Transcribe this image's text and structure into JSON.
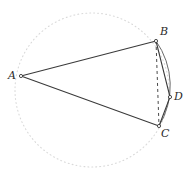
{
  "figure": {
    "type": "geometry-diagram",
    "width": 191,
    "height": 175,
    "background_color": "#ffffff"
  },
  "colors": {
    "circle_dotted": "#d9d9d9",
    "solid_line": "#3a3a3a",
    "arc_line": "#6b6b6b",
    "dashed_line": "#4a4a4a",
    "label_text": "#2b2b2b",
    "vertex_marker": "#ffffff"
  },
  "circle": {
    "name": "dotted-circle",
    "center_x": 92,
    "center_y": 90,
    "radius": 77,
    "style": "dotted",
    "stroke_width": 1.1,
    "dash_pattern": "0.9 3.1"
  },
  "points": [
    {
      "id": "A",
      "label": "A",
      "x": 21,
      "y": 76,
      "label_x": 8,
      "label_y": 70,
      "marker": "open-circle"
    },
    {
      "id": "B",
      "label": "B",
      "x": 156,
      "y": 41,
      "label_x": 160,
      "label_y": 26,
      "marker": "open-circle"
    },
    {
      "id": "C",
      "label": "C",
      "x": 159,
      "y": 126,
      "label_x": 161,
      "label_y": 128,
      "marker": "open-circle"
    },
    {
      "id": "D",
      "label": "D",
      "x": 170,
      "y": 97,
      "label_x": 174,
      "label_y": 91,
      "marker": "open-circle"
    }
  ],
  "segments": [
    {
      "name": "segment-AB",
      "from": "A",
      "to": "B",
      "style": "solid"
    },
    {
      "name": "segment-AC",
      "from": "A",
      "to": "C",
      "style": "solid"
    },
    {
      "name": "segment-BD",
      "from": "B",
      "to": "D",
      "style": "solid"
    },
    {
      "name": "segment-DC",
      "from": "D",
      "to": "C",
      "style": "solid"
    },
    {
      "name": "chord-BC",
      "from": "B",
      "to": "C",
      "style": "dashed",
      "dash_pattern": "3 3"
    }
  ],
  "arcs": [
    {
      "name": "arc-BDC",
      "from": "B",
      "through": "D",
      "to": "C",
      "style": "solid",
      "description": "circular arc of the dotted circle from B through D to C"
    }
  ],
  "paths": {
    "segment_AB": "M 21 76 L 156 41",
    "segment_AC": "M 21 76 L 159 126",
    "segment_BD": "M 156 41 L 170 97",
    "segment_DC": "M 170 97 L 159 126",
    "chord_BC": "M 156 41 L 159 126",
    "arc_BDC": "M 156 41 A 77 77 0 0 1 159 126"
  }
}
